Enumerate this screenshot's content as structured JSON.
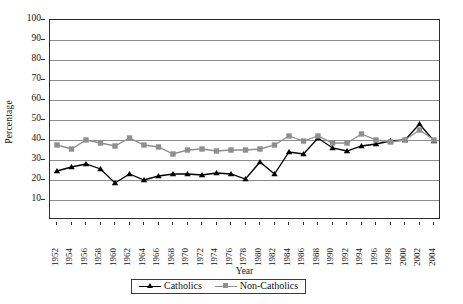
{
  "chart_data": {
    "type": "line",
    "title": "",
    "xlabel": "Year",
    "ylabel": "Percentage",
    "ylim": [
      0,
      100
    ],
    "ytick_step": 10,
    "grid": true,
    "legend_position": "bottom-center",
    "categories": [
      1952,
      1954,
      1956,
      1958,
      1960,
      1962,
      1964,
      1966,
      1968,
      1970,
      1972,
      1974,
      1976,
      1978,
      1980,
      1982,
      1984,
      1986,
      1988,
      1990,
      1992,
      1994,
      1996,
      1998,
      2000,
      2002,
      2004
    ],
    "yticks": [
      0,
      10,
      20,
      30,
      40,
      50,
      60,
      70,
      80,
      90,
      100
    ],
    "series": [
      {
        "name": "Catholics",
        "color": "#000000",
        "marker": "triangle",
        "values": [
          24.5,
          26.5,
          28,
          25.5,
          18.5,
          23,
          20,
          22,
          23,
          23,
          22.5,
          23.5,
          23,
          20.5,
          29,
          23,
          34,
          33,
          41,
          36,
          34.5,
          37,
          38,
          39.5,
          40,
          48,
          39.5
        ]
      },
      {
        "name": "Non-Catholics",
        "color": "#8f8f8f",
        "marker": "square",
        "values": [
          37.5,
          35.5,
          40,
          38.5,
          37,
          41,
          37.5,
          36.5,
          33,
          35,
          35.5,
          34.5,
          35,
          35,
          35.5,
          37.5,
          42,
          39.5,
          42,
          38.5,
          38.5,
          43,
          40,
          39,
          40,
          45,
          40
        ]
      }
    ]
  },
  "legend": {
    "items": [
      {
        "label": "Catholics"
      },
      {
        "label": "Non-Catholics"
      }
    ]
  }
}
